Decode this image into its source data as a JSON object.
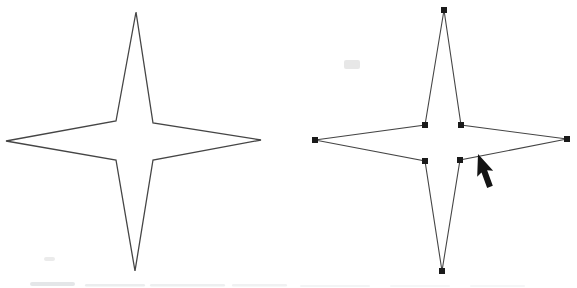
{
  "canvas": {
    "width": 577,
    "height": 288,
    "background": "#ffffff",
    "stroke_color": "#454545",
    "handle_color": "#1a1a1a",
    "cursor_color": "#141414"
  },
  "shapes": {
    "left_star": {
      "type": "polygon",
      "role": "four-point-star-outline-preview",
      "fill": "#ffffff",
      "stroke_width": 1.3,
      "points": [
        [
          136,
          12
        ],
        [
          153,
          123
        ],
        [
          261,
          140
        ],
        [
          153,
          160
        ],
        [
          135,
          271
        ],
        [
          116,
          160
        ],
        [
          6,
          141
        ],
        [
          116,
          121
        ]
      ]
    },
    "right_star": {
      "type": "polygon",
      "role": "four-point-star-path-selected",
      "fill": "#ffffff",
      "stroke_width": 1.1,
      "points": [
        [
          444,
          10
        ],
        [
          461,
          125
        ],
        [
          567,
          139
        ],
        [
          460,
          160
        ],
        [
          442,
          271
        ],
        [
          425,
          161
        ],
        [
          315,
          140
        ],
        [
          425,
          125
        ]
      ],
      "handles": {
        "size": 6,
        "at_vertices": true,
        "count": 8
      }
    }
  },
  "cursor": {
    "type": "arrow-pointer",
    "tip": [
      478,
      154
    ],
    "rotation_deg": -20,
    "outline": [
      [
        0,
        0
      ],
      [
        -8.5,
        21
      ],
      [
        -3,
        18.5
      ],
      [
        -3,
        35
      ],
      [
        3,
        35
      ],
      [
        3,
        18.5
      ],
      [
        8.5,
        21
      ]
    ]
  },
  "scan_artifacts": [
    {
      "x": 344,
      "y": 60,
      "w": 16,
      "h": 9,
      "color": "#dfdfdf",
      "opacity": 0.75
    },
    {
      "x": 44,
      "y": 257,
      "w": 11,
      "h": 4,
      "color": "#e4e4e4",
      "opacity": 0.75
    },
    {
      "x": 30,
      "y": 282,
      "w": 45,
      "h": 4,
      "color": "#d9dcde",
      "opacity": 0.7
    },
    {
      "x": 85,
      "y": 284,
      "w": 60,
      "h": 2.5,
      "color": "#e3e5e7",
      "opacity": 0.7
    },
    {
      "x": 150,
      "y": 284,
      "w": 75,
      "h": 2.5,
      "color": "#e6e8ea",
      "opacity": 0.7
    },
    {
      "x": 232,
      "y": 284,
      "w": 55,
      "h": 2.5,
      "color": "#e6e8ea",
      "opacity": 0.6
    },
    {
      "x": 300,
      "y": 285,
      "w": 70,
      "h": 2,
      "color": "#ebedee",
      "opacity": 0.6
    },
    {
      "x": 390,
      "y": 285,
      "w": 60,
      "h": 2,
      "color": "#eceeef",
      "opacity": 0.5
    },
    {
      "x": 470,
      "y": 285,
      "w": 55,
      "h": 2,
      "color": "#eceeef",
      "opacity": 0.5
    }
  ]
}
